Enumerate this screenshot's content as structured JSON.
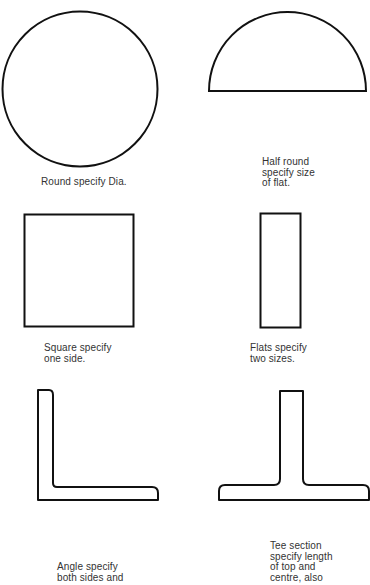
{
  "diagram": {
    "shapes": [
      {
        "id": "round",
        "shape": "circle",
        "caption": "Round specify Dia."
      },
      {
        "id": "half-round",
        "shape": "semicircle",
        "caption": "Half round\nspecify size\nof flat."
      },
      {
        "id": "square",
        "shape": "square",
        "caption": "Square specify\none side."
      },
      {
        "id": "flat",
        "shape": "rectangle",
        "caption": "Flats specify\ntwo sizes."
      },
      {
        "id": "angle",
        "shape": "angle-section",
        "caption": "Angle specify\nboth sides and"
      },
      {
        "id": "tee",
        "shape": "tee-section",
        "caption": "Tee section\nspecify length\nof top and\ncentre, also"
      }
    ],
    "stroke_color": "#111111",
    "background": "#ffffff"
  }
}
